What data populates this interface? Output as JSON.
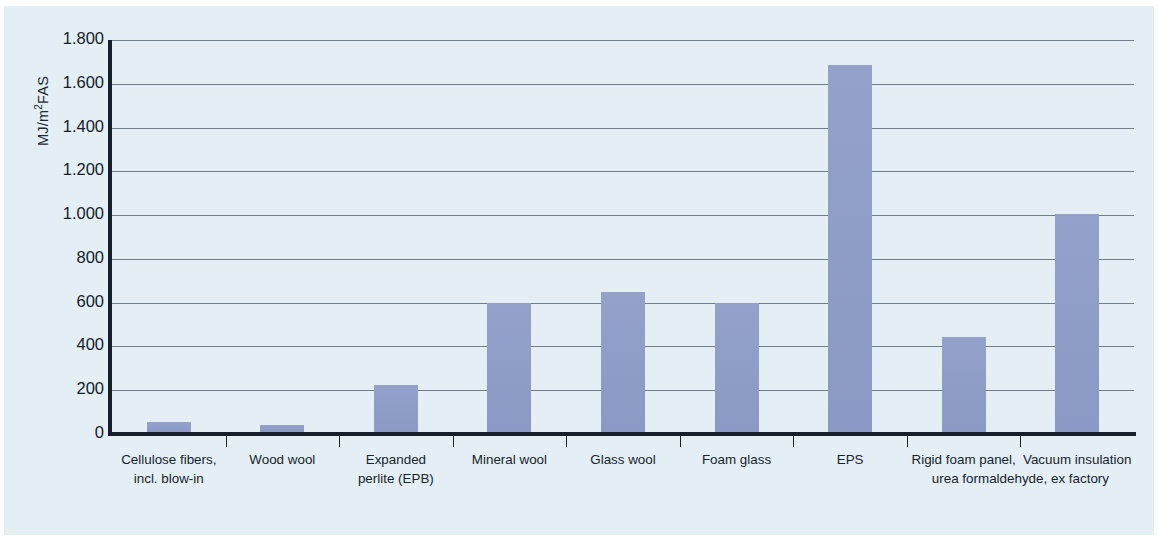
{
  "chart_data": {
    "type": "bar",
    "title": "",
    "subtitle": "",
    "xlabel": "",
    "ylabel": "MJ/m²FAS",
    "ylabel_main": "MJ/m",
    "ylabel_sup": "2",
    "ylabel_tail": "FAS",
    "ylim": [
      0,
      1800
    ],
    "ytick_labels": [
      "0",
      "200",
      "400",
      "600",
      "800",
      "1.000",
      "1.200",
      "1.400",
      "1.600",
      "1.800"
    ],
    "ytick_values": [
      0,
      200,
      400,
      600,
      800,
      1000,
      1200,
      1400,
      1600,
      1800
    ],
    "grid": "horizontal",
    "legend": "none",
    "bar_color": "#8e9dc8",
    "panel_color": "#e3eff5",
    "axis_color": "#15202a",
    "categories": [
      "Cellulose fibers, incl. blow-in",
      "Wood wool",
      "Expanded perlite (EPB)",
      "Mineral wool",
      "Glass wool",
      "Foam glass",
      "EPS",
      "Rigid foam panel, urea formaldehyde, ex factory",
      "Vacuum insulation"
    ],
    "values": [
      55,
      40,
      225,
      600,
      650,
      600,
      1685,
      445,
      1005
    ]
  },
  "axis": {
    "x_labels": [
      {
        "line1": "Cellulose fibers,",
        "line2": "incl. blow-in"
      },
      {
        "line1": "Wood wool",
        "line2": ""
      },
      {
        "line1": "Expanded",
        "line2": "perlite (EPB)"
      },
      {
        "line1": "Mineral wool",
        "line2": ""
      },
      {
        "line1": "Glass wool",
        "line2": ""
      },
      {
        "line1": "Foam glass",
        "line2": ""
      },
      {
        "line1": "EPS",
        "line2": ""
      },
      {
        "line1": "Rigid foam panel,",
        "line2": ""
      },
      {
        "line1": "Vacuum insulation",
        "line2": ""
      }
    ],
    "shared_sub_label": "urea formaldehyde, ex factory"
  }
}
